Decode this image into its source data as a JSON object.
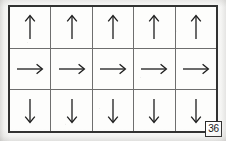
{
  "figure": {
    "kind": "arrow-grid-worksheet",
    "number_label": "36",
    "rows": 3,
    "columns": 5,
    "colors": {
      "paper": "#fbfbfa",
      "outer_border": "#2f2f2f",
      "inner_gridline": "#6e6e6e",
      "arrow_stroke": "#1d1d1d",
      "page_background": "#f2f1ef"
    },
    "grid": [
      {
        "row_index": 0,
        "direction": "up",
        "cells": [
          {
            "icon": "arrow-up-icon",
            "direction": "up"
          },
          {
            "icon": "arrow-up-icon",
            "direction": "up"
          },
          {
            "icon": "arrow-up-icon",
            "direction": "up"
          },
          {
            "icon": "arrow-up-icon",
            "direction": "up"
          },
          {
            "icon": "arrow-up-icon",
            "direction": "up"
          }
        ]
      },
      {
        "row_index": 1,
        "direction": "right",
        "cells": [
          {
            "icon": "arrow-right-icon",
            "direction": "right"
          },
          {
            "icon": "arrow-right-icon",
            "direction": "right"
          },
          {
            "icon": "arrow-right-icon",
            "direction": "right"
          },
          {
            "icon": "arrow-right-icon",
            "direction": "right"
          },
          {
            "icon": "arrow-right-icon",
            "direction": "right"
          }
        ]
      },
      {
        "row_index": 2,
        "direction": "down",
        "cells": [
          {
            "icon": "arrow-down-icon",
            "direction": "down"
          },
          {
            "icon": "arrow-down-icon",
            "direction": "down"
          },
          {
            "icon": "arrow-down-icon",
            "direction": "down"
          },
          {
            "icon": "arrow-down-icon",
            "direction": "down"
          },
          {
            "icon": "arrow-down-icon",
            "direction": "down"
          }
        ]
      }
    ]
  }
}
